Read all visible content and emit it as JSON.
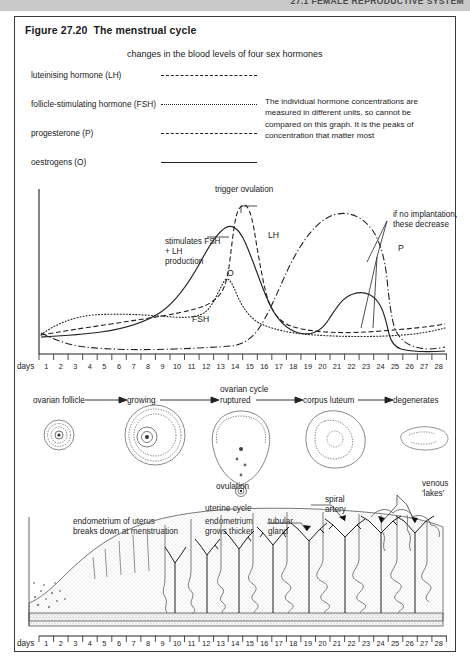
{
  "running_head": "27.1  FEMALE REPRODUCTIVE SYSTEM",
  "figure": {
    "title": "Figure 27.20  The menstrual cycle",
    "graph_title": "changes in the blood levels of four sex hormones",
    "note": "The individual hormone concentrations are measured in different units, so cannot be compared on this graph. It is the peaks of concentration that matter most"
  },
  "legend": {
    "items": [
      {
        "label": "luteinising hormone (LH)",
        "style": "dashed",
        "key": "LH"
      },
      {
        "label": "follicle-stimulating hormone (FSH)",
        "style": "dotted",
        "key": "FSH"
      },
      {
        "label": "progesterone (P)",
        "style": "dash-dot",
        "key": "P"
      },
      {
        "label": "oestrogens (O)",
        "style": "solid",
        "key": "O"
      }
    ]
  },
  "annotations": {
    "trigger": "trigger\novulation",
    "stimulates": "stimulates\nFSH + LH\nproduction",
    "no_implantation": "if no implantation,\nthese decrease",
    "lh": "LH",
    "o": "O",
    "fsh": "FSH",
    "p": "P"
  },
  "axis": {
    "days_word": "days",
    "ticks": [
      1,
      2,
      3,
      4,
      5,
      6,
      7,
      8,
      9,
      10,
      11,
      12,
      13,
      14,
      15,
      16,
      17,
      18,
      19,
      20,
      21,
      22,
      23,
      24,
      25,
      26,
      27,
      28
    ]
  },
  "ovarian": {
    "title": "ovarian cycle",
    "stages": [
      "ovarian follicle",
      "growing",
      "ruptured",
      "corpus luteum",
      "degenerates"
    ],
    "ovulation_label": "ovulation"
  },
  "uterine": {
    "title": "uterine cycle",
    "left_label": "endometrium of uterus breaks down at menstruation",
    "mid_label": "endometrium grows thicker",
    "gland_label": "tubular gland",
    "spiral_label": "spiral artery",
    "venous_label": "venous 'lakes'"
  },
  "chart_data": {
    "type": "line",
    "title": "changes in the blood levels of four sex hormones",
    "xlabel": "days",
    "ylabel": "",
    "x": [
      1,
      2,
      3,
      4,
      5,
      6,
      7,
      8,
      9,
      10,
      11,
      12,
      13,
      14,
      15,
      16,
      17,
      18,
      19,
      20,
      21,
      22,
      23,
      24,
      25,
      26,
      27,
      28
    ],
    "xlim": [
      1,
      28
    ],
    "ylim": [
      0,
      100
    ],
    "grid": false,
    "legend_position": "top-left",
    "series": [
      {
        "name": "luteinising hormone (LH)",
        "key": "LH",
        "style": "dashed",
        "values": [
          12,
          12,
          13,
          13,
          14,
          15,
          15,
          16,
          17,
          18,
          20,
          26,
          55,
          95,
          52,
          24,
          18,
          16,
          15,
          14,
          14,
          14,
          14,
          14,
          14,
          13,
          13,
          13
        ]
      },
      {
        "name": "follicle-stimulating hormone (FSH)",
        "key": "FSH",
        "style": "dotted",
        "values": [
          14,
          20,
          24,
          26,
          27,
          28,
          28,
          28,
          27,
          27,
          26,
          26,
          30,
          45,
          28,
          20,
          17,
          15,
          14,
          13,
          12,
          12,
          12,
          12,
          12,
          13,
          14,
          16
        ]
      },
      {
        "name": "progesterone (P)",
        "key": "P",
        "style": "dash-dot",
        "values": [
          10,
          7,
          5,
          4,
          3,
          3,
          3,
          3,
          3,
          3,
          3,
          3,
          3,
          4,
          8,
          20,
          40,
          60,
          74,
          80,
          82,
          80,
          72,
          58,
          38,
          20,
          10,
          6
        ]
      },
      {
        "name": "oestrogens (O)",
        "key": "O",
        "style": "solid",
        "values": [
          9,
          9,
          9,
          10,
          10,
          11,
          12,
          14,
          18,
          26,
          40,
          58,
          70,
          72,
          52,
          34,
          30,
          33,
          38,
          40,
          40,
          39,
          36,
          28,
          16,
          9,
          8,
          8
        ]
      }
    ],
    "annotations": [
      {
        "text": "trigger ovulation",
        "target_series": "LH",
        "x": 14
      },
      {
        "text": "stimulates FSH + LH production",
        "target_series": "O",
        "x": 13
      },
      {
        "text": "if no implantation, these decrease",
        "x": 25
      }
    ]
  }
}
